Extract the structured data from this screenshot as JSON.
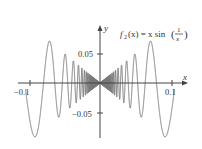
{
  "chart_data": {
    "type": "line",
    "xlabel": "x",
    "ylabel": "y",
    "xlim": [
      -0.11,
      0.11
    ],
    "ylim": [
      -0.06,
      0.06
    ],
    "xticks": [
      -0.1,
      0.1
    ],
    "xtick_labels": [
      "−0.1",
      "0.1"
    ],
    "yticks": [
      0.05,
      -0.05
    ],
    "ytick_labels": [
      "0.05",
      "−0.05"
    ],
    "grid": false,
    "legend": null,
    "series": [
      {
        "name": "f2(x) = x sin(1/x)",
        "function": "x*sin(1/x)",
        "domain": [
          -0.105,
          0.105
        ],
        "color": "#777777"
      }
    ]
  },
  "labels": {
    "func_name": "f",
    "func_sub": "2",
    "func_rest": "(x) = x sin",
    "frac_num": "1",
    "frac_den": "x",
    "x_axis": "x",
    "y_axis": "y",
    "xtick_neg": "−0.1",
    "xtick_pos": "0.1",
    "ytick_pos": "0.05",
    "ytick_neg": "−0.05"
  }
}
